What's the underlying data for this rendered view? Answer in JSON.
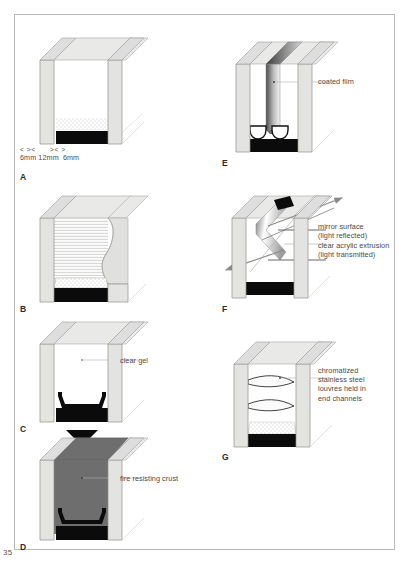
{
  "page": {
    "number": "35",
    "background_color": "#ffffff",
    "frame_color": "#b9b9b9"
  },
  "palette": {
    "glass_face": "#e3e3e1",
    "glass_top": "#d8d8d6",
    "glass_edge": "#9a9a98",
    "glass_light": "#efefed",
    "seal_black": "#0b0b0b",
    "crust_gray": "#6e6e6e",
    "film_dark": "#4a4a4a",
    "leader_line": "#9a9a98",
    "text": "#4a4a4a",
    "stipple": "#c9c9c9"
  },
  "figures": [
    {
      "id": "A",
      "label": "A",
      "description": "double glazing unit cavity with desiccant and black sealant base",
      "dimensions": {
        "text": "6mm 12mm  6mm",
        "parts": [
          "6mm",
          "12mm",
          "6mm"
        ],
        "markers": "< ><      >< >"
      },
      "callouts": []
    },
    {
      "id": "B",
      "label": "B",
      "description": "cavity filled with horizontally hatched interlayer",
      "callouts": []
    },
    {
      "id": "C",
      "label": "C",
      "description": "unit filled with clear gel before fire exposure",
      "callouts": [
        {
          "name": "clear-gel",
          "text": "clear gel"
        }
      ]
    },
    {
      "id": "D",
      "label": "D",
      "description": "unit after fire exposure with opaque intumescent crust",
      "callouts": [
        {
          "name": "fire-resisting-crust",
          "text": "fire resisting crust"
        }
      ]
    },
    {
      "id": "E",
      "label": "E",
      "description": "triple unit with suspended coated film and two spacer bars",
      "callouts": [
        {
          "name": "coated-film",
          "text": "coated film"
        }
      ]
    },
    {
      "id": "F",
      "label": "F",
      "description": "chevron acrylic extrusion reflecting and transmitting light",
      "callouts": [
        {
          "name": "mirror-surface",
          "text": "mirror surface\n(light reflected)"
        },
        {
          "name": "clear-acrylic-extrusion",
          "text": "clear acrylic extrusion\n(light transmitted)"
        }
      ]
    },
    {
      "id": "G",
      "label": "G",
      "description": "cavity with two curved louvre blades in end channels",
      "callouts": [
        {
          "name": "louvres",
          "text": "chromatized\nstainless steel\nlouvres held in\nend channels"
        }
      ]
    }
  ]
}
